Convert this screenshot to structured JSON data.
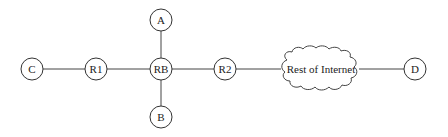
{
  "diagram": {
    "type": "network-topology",
    "nodes": [
      {
        "id": "C",
        "label": "C",
        "kind": "host",
        "x": 32,
        "y": 69
      },
      {
        "id": "R1",
        "label": "R1",
        "kind": "router",
        "x": 96,
        "y": 69
      },
      {
        "id": "RB",
        "label": "RB",
        "kind": "router",
        "x": 161,
        "y": 69
      },
      {
        "id": "A",
        "label": "A",
        "kind": "host",
        "x": 161,
        "y": 20
      },
      {
        "id": "B",
        "label": "B",
        "kind": "host",
        "x": 161,
        "y": 117
      },
      {
        "id": "R2",
        "label": "R2",
        "kind": "router",
        "x": 225,
        "y": 69
      },
      {
        "id": "Internet",
        "label": "Rest of Internet",
        "kind": "cloud",
        "x": 322,
        "y": 69
      },
      {
        "id": "D",
        "label": "D",
        "kind": "host",
        "x": 415,
        "y": 69
      }
    ],
    "edges": [
      {
        "from": "C",
        "to": "R1"
      },
      {
        "from": "R1",
        "to": "RB"
      },
      {
        "from": "RB",
        "to": "A"
      },
      {
        "from": "RB",
        "to": "B"
      },
      {
        "from": "RB",
        "to": "R2"
      },
      {
        "from": "R2",
        "to": "Internet"
      },
      {
        "from": "Internet",
        "to": "D"
      }
    ],
    "colors": {
      "stroke": "#333333",
      "fill": "#ffffff",
      "text": "#222222"
    }
  }
}
